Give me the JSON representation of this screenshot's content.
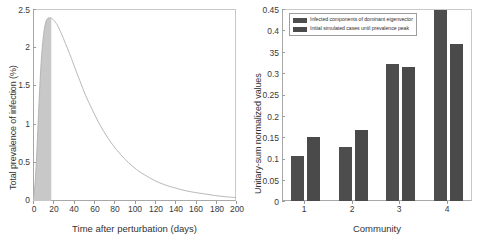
{
  "chart_data": [
    {
      "panel": "left",
      "type": "area",
      "title": "",
      "xlabel": "Time after perturbation (days)",
      "ylabel": "Total prevalence of infection (%)",
      "xlim": [
        0,
        200
      ],
      "ylim": [
        0,
        2.5
      ],
      "xticks": [
        "0",
        "20",
        "40",
        "60",
        "80",
        "100",
        "120",
        "140",
        "160",
        "180",
        "200"
      ],
      "yticks": [
        "0",
        "0.5",
        "1",
        "1.5",
        "2",
        "2.5"
      ],
      "grid": false,
      "legend_position": "none",
      "curve_color": "#b0b0b0",
      "fill_color": "#c8c8c8",
      "annotations": [
        "Shaded region spans from t=0 to the prevalence peak at t=18 days"
      ],
      "series": [
        {
          "name": "Total prevalence of infection",
          "x": [
            0,
            2,
            4,
            6,
            8,
            10,
            12,
            14,
            16,
            18,
            20,
            24,
            28,
            32,
            36,
            40,
            46,
            52,
            58,
            64,
            70,
            78,
            86,
            94,
            102,
            110,
            120,
            130,
            140,
            150,
            160,
            170,
            180,
            190,
            200
          ],
          "values": [
            0.02,
            0.22,
            0.7,
            1.3,
            1.8,
            2.12,
            2.3,
            2.37,
            2.385,
            2.38,
            2.36,
            2.29,
            2.18,
            2.05,
            1.92,
            1.78,
            1.57,
            1.37,
            1.2,
            1.04,
            0.9,
            0.74,
            0.61,
            0.5,
            0.41,
            0.34,
            0.265,
            0.21,
            0.17,
            0.135,
            0.11,
            0.09,
            0.07,
            0.055,
            0.045
          ]
        }
      ],
      "fill_x_end": 18,
      "peak": {
        "x": 18,
        "y": 2.385
      }
    },
    {
      "panel": "right",
      "type": "bar",
      "title": "",
      "xlabel": "Community",
      "ylabel": "Unitary-sum normalized values",
      "categories": [
        "1",
        "2",
        "3",
        "4"
      ],
      "xticks": [
        "1",
        "2",
        "3",
        "4"
      ],
      "yticks": [
        "0",
        "0.05",
        "0.1",
        "0.15",
        "0.2",
        "0.25",
        "0.3",
        "35",
        "0.4",
        "0.45"
      ],
      "ytick_values": [
        0,
        0.05,
        0.1,
        0.15,
        0.2,
        0.25,
        0.3,
        0.35,
        0.4,
        0.45
      ],
      "ylim": [
        0,
        0.45
      ],
      "grid": false,
      "legend_position": "top-left",
      "bar_color_series1": "#4d4d4d",
      "bar_color_series2": "#4a4a4a",
      "series": [
        {
          "name": "Infected components of dominant eigenvector",
          "values": [
            0.105,
            0.127,
            0.322,
            0.447
          ]
        },
        {
          "name": "Initial simulated cases until prevalence peak",
          "values": [
            0.149,
            0.167,
            0.314,
            0.367
          ]
        }
      ]
    }
  ],
  "left_panel": {
    "ylabel": "Total prevalence of infection (%)",
    "xlabel": "Time after perturbation (days)",
    "yticks": [
      "2.5",
      "2",
      "1.5",
      "1",
      "0.5",
      "0"
    ],
    "xticks": [
      "0",
      "20",
      "40",
      "60",
      "80",
      "100",
      "120",
      "140",
      "160",
      "180",
      "200"
    ]
  },
  "right_panel": {
    "ylabel": "Unitary-sum normalized values",
    "xlabel": "Community",
    "yticks": [
      "0.45",
      "0.4",
      "35",
      "0.3",
      "0.25",
      "0.2",
      "0.15",
      "0.1",
      "0.05",
      "0"
    ],
    "xticks": [
      "1",
      "2",
      "3",
      "4"
    ],
    "legend": {
      "items": [
        {
          "label": "Infected components of dominant eigenvector",
          "color": "#4d4d4d"
        },
        {
          "label": "Initial simulated cases until prevalence peak",
          "color": "#4a4a4a"
        }
      ]
    }
  }
}
